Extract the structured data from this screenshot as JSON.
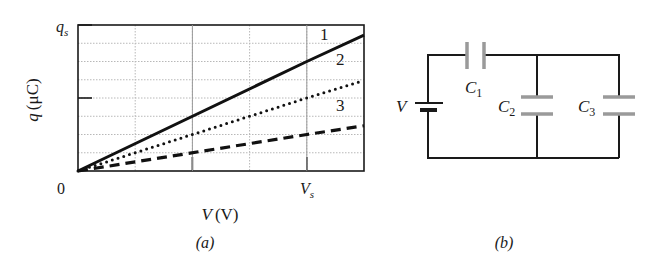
{
  "figure": {
    "panel_a_label": "(a)",
    "panel_b_label": "(b)"
  },
  "chart_data": {
    "type": "line",
    "title": "",
    "xlabel": "V (V)",
    "xlabel_var": "V",
    "xlabel_unit": "(V)",
    "ylabel": "q (μC)",
    "ylabel_var": "q",
    "ylabel_unit": "(μC)",
    "x_tick_labels": [
      {
        "label": "0",
        "value": 0
      },
      {
        "label": "V_s",
        "value": 1.0
      }
    ],
    "y_tick_labels": [
      {
        "label": "q_s",
        "value": 1.0
      }
    ],
    "origin_label": "0",
    "x_unit": "V_s",
    "y_unit": "q_s",
    "xlim": [
      0,
      1.25
    ],
    "ylim": [
      0,
      1.0
    ],
    "grid": {
      "on": true,
      "x_divisions": 5,
      "y_divisions": 8,
      "x_major_ticks": [
        0.5,
        1.0
      ],
      "y_major_ticks": [
        0.5,
        1.0
      ]
    },
    "legend": "inline labels at right end of each line",
    "series": [
      {
        "name": "1",
        "style": "solid",
        "x": [
          0,
          1.0,
          1.25
        ],
        "values": [
          0,
          0.75,
          0.93
        ]
      },
      {
        "name": "2",
        "style": "dotted",
        "x": [
          0,
          1.0,
          1.25
        ],
        "values": [
          0,
          0.5,
          0.62
        ]
      },
      {
        "name": "3",
        "style": "dashed",
        "x": [
          0,
          1.0,
          1.25
        ],
        "values": [
          0,
          0.25,
          0.31
        ]
      }
    ]
  },
  "circuit": {
    "source_label": "V",
    "components": [
      {
        "name": "C",
        "sub": "1",
        "position": "series, top wire"
      },
      {
        "name": "C",
        "sub": "2",
        "position": "parallel branch, middle"
      },
      {
        "name": "C",
        "sub": "3",
        "position": "parallel branch, right"
      }
    ],
    "wire_color": "#1a1a1a",
    "capacitor_color": "#9a9a9a"
  }
}
